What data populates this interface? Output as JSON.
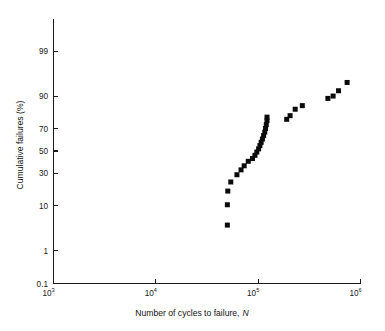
{
  "chart_data": {
    "type": "scatter",
    "title": "",
    "subtitle": "",
    "xlabel_main": "Number of cycles to failure,",
    "xlabel_symbol": "N",
    "ylabel": "Cumulative failures (%)",
    "x_scale": "log10",
    "y_scale": "normal-probability",
    "xlim": [
      1000,
      1000000
    ],
    "ylim": [
      0.1,
      99.9
    ],
    "grid": false,
    "legend": null,
    "x_ticks": [
      {
        "value": 1000,
        "base": "10",
        "exponent": "3",
        "label": "10³"
      },
      {
        "value": 10000,
        "base": "10",
        "exponent": "4",
        "label": "10⁴"
      },
      {
        "value": 100000,
        "base": "10",
        "exponent": "5",
        "label": "10⁵"
      },
      {
        "value": 1000000,
        "base": "10",
        "exponent": "6",
        "label": "10⁶"
      }
    ],
    "y_ticks": [
      {
        "value": 99,
        "label": "99"
      },
      {
        "value": 90,
        "label": "90"
      },
      {
        "value": 70,
        "label": "70"
      },
      {
        "value": 50,
        "label": "50"
      },
      {
        "value": 30,
        "label": "30"
      },
      {
        "value": 10,
        "label": "10"
      },
      {
        "value": 1,
        "label": "1"
      },
      {
        "value": 0.1,
        "label": "0.1"
      }
    ],
    "marker_style": "filled-square",
    "marker_color": "#0b0b0b",
    "marker_size_px": 5,
    "series": [
      {
        "name": "Cumulative failure distribution",
        "points": [
          {
            "x": 50000,
            "y": 4.2
          },
          {
            "x": 50000,
            "y": 10.5
          },
          {
            "x": 50500,
            "y": 17.5
          },
          {
            "x": 54000,
            "y": 23.5
          },
          {
            "x": 62000,
            "y": 29.0
          },
          {
            "x": 68000,
            "y": 33.0
          },
          {
            "x": 73000,
            "y": 36.5
          },
          {
            "x": 80000,
            "y": 40.5
          },
          {
            "x": 88000,
            "y": 43.0
          },
          {
            "x": 93000,
            "y": 46.0
          },
          {
            "x": 97000,
            "y": 49.0
          },
          {
            "x": 101000,
            "y": 52.0
          },
          {
            "x": 104000,
            "y": 55.0
          },
          {
            "x": 107000,
            "y": 58.0
          },
          {
            "x": 110000,
            "y": 61.0
          },
          {
            "x": 113000,
            "y": 64.0
          },
          {
            "x": 116000,
            "y": 67.0
          },
          {
            "x": 118000,
            "y": 70.0
          },
          {
            "x": 120000,
            "y": 73.0
          },
          {
            "x": 122000,
            "y": 76.0
          },
          {
            "x": 122000,
            "y": 78.5
          },
          {
            "x": 190000,
            "y": 77.0
          },
          {
            "x": 205000,
            "y": 79.5
          },
          {
            "x": 230000,
            "y": 83.5
          },
          {
            "x": 270000,
            "y": 85.5
          },
          {
            "x": 480000,
            "y": 89.0
          },
          {
            "x": 540000,
            "y": 90.0
          },
          {
            "x": 610000,
            "y": 92.0
          },
          {
            "x": 740000,
            "y": 94.5
          }
        ]
      }
    ]
  },
  "figure": {
    "background_color": "#ffffff",
    "axis_color": "#1a1a1a"
  }
}
